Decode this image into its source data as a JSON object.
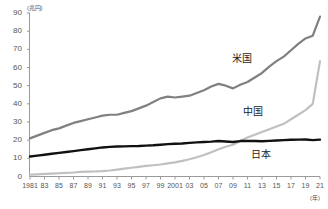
{
  "chart_data": {
    "type": "line",
    "title": "",
    "ylabel": "(兆円)",
    "xlabel": "(年)",
    "ylim": [
      0,
      90
    ],
    "xlim": [
      1981,
      2021
    ],
    "yticks": [
      10,
      20,
      30,
      40,
      50,
      60,
      70,
      80,
      90
    ],
    "ytick_labels": [
      "10",
      "20",
      "30",
      "40",
      "50",
      "60",
      "70",
      "80",
      "90"
    ],
    "xticks": [
      1981,
      1983,
      1985,
      1987,
      1989,
      1991,
      1993,
      1995,
      1997,
      1999,
      2001,
      2003,
      2005,
      2007,
      2009,
      2011,
      2013,
      2015,
      2017,
      2019,
      2021
    ],
    "xtick_labels": [
      "1981",
      "83",
      "85",
      "87",
      "89",
      "91",
      "93",
      "95",
      "97",
      "99",
      "2001",
      "03",
      "05",
      "07",
      "09",
      "11",
      "13",
      "15",
      "17",
      "19",
      "21"
    ],
    "grid": false,
    "legend_position": "inline-right",
    "x": [
      1981,
      1982,
      1983,
      1984,
      1985,
      1986,
      1987,
      1988,
      1989,
      1990,
      1991,
      1992,
      1993,
      1994,
      1995,
      1996,
      1997,
      1998,
      1999,
      2000,
      2001,
      2002,
      2003,
      2004,
      2005,
      2006,
      2007,
      2008,
      2009,
      2010,
      2011,
      2012,
      2013,
      2014,
      2015,
      2016,
      2017,
      2018,
      2019,
      2020,
      2021
    ],
    "series": [
      {
        "name": "米国",
        "label": "米国",
        "color": "#808080",
        "values": [
          21.0,
          22.5,
          24.0,
          25.5,
          26.5,
          28.0,
          29.5,
          30.5,
          31.5,
          32.5,
          33.5,
          34.0,
          34.0,
          35.0,
          36.0,
          37.5,
          39.0,
          41.0,
          43.0,
          44.0,
          43.5,
          44.0,
          44.5,
          46.0,
          47.5,
          49.5,
          51.0,
          50.0,
          48.5,
          50.5,
          52.0,
          54.5,
          57.0,
          60.5,
          63.5,
          66.0,
          69.5,
          73.0,
          76.0,
          77.5,
          88.0
        ]
      },
      {
        "name": "中国",
        "label": "中国",
        "color": "#c0c0c0",
        "values": [
          1.0,
          1.2,
          1.4,
          1.6,
          1.8,
          2.0,
          2.2,
          2.5,
          2.7,
          2.8,
          3.0,
          3.3,
          3.8,
          4.3,
          4.8,
          5.3,
          5.8,
          6.2,
          6.6,
          7.2,
          7.8,
          8.6,
          9.5,
          10.6,
          11.8,
          13.3,
          15.0,
          16.4,
          17.5,
          19.5,
          21.5,
          23.0,
          24.5,
          26.0,
          27.5,
          29.0,
          31.5,
          34.0,
          36.5,
          40.0,
          63.5
        ]
      },
      {
        "name": "日本",
        "label": "日本",
        "color": "#111111",
        "values": [
          11.0,
          11.5,
          12.0,
          12.5,
          13.0,
          13.5,
          14.0,
          14.5,
          15.0,
          15.5,
          16.0,
          16.3,
          16.5,
          16.6,
          16.7,
          16.8,
          17.0,
          17.2,
          17.5,
          17.8,
          18.0,
          18.2,
          18.5,
          18.8,
          19.0,
          19.2,
          19.5,
          19.3,
          19.0,
          19.5,
          19.6,
          19.5,
          19.4,
          19.6,
          19.8,
          20.0,
          20.2,
          20.3,
          20.4,
          20.0,
          20.3
        ]
      }
    ]
  },
  "axis": {
    "y_unit": "(兆円)",
    "x_unit": "(年)"
  }
}
